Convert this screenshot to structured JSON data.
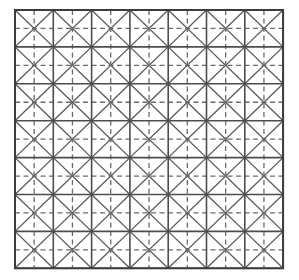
{
  "figure": {
    "name": "triangulated-square-mesh",
    "background_color": "#ffffff"
  },
  "canvas": {
    "width": 299,
    "height": 280
  },
  "grid": {
    "origin_x": 15,
    "origin_y": 10,
    "columns": 7,
    "rows": 7,
    "cell_width": 38.3,
    "cell_height": 36.9,
    "total_width": 268,
    "total_height": 258
  },
  "strokes": {
    "grid_line_color": "#4d4d4d",
    "grid_line_width": 1.6,
    "diagonal_color": "#595959",
    "diagonal_width": 1.3,
    "dashed_color": "#6b6b6b",
    "dashed_width": 1.3,
    "dash_pattern": "5,3.5",
    "outer_border_color": "#3d3d3d",
    "outer_border_width": 2.0
  },
  "elements": {
    "cell_square_label": "cell-square",
    "diagonal_down_label": "diagonal-down",
    "diagonal_up_label": "diagonal-up",
    "dashed_horizontal_label": "dashed-horizontal-midline",
    "dashed_vertical_label": "dashed-vertical-midline"
  },
  "counts": {
    "cells": 49,
    "vertical_grid_lines": 8,
    "horizontal_grid_lines": 8,
    "dashed_midlines_horizontal": 7,
    "dashed_midlines_vertical": 7,
    "diagonals": 98
  }
}
